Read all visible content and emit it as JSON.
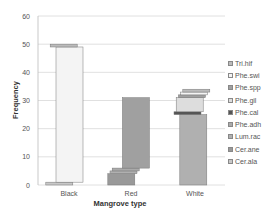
{
  "chart_data": {
    "type": "bar",
    "stacked": true,
    "title": "",
    "xlabel": "Mangrove type",
    "ylabel": "Frequency",
    "ylim": [
      0,
      60
    ],
    "yticks": [
      0,
      10,
      20,
      30,
      40,
      50,
      60
    ],
    "grid": true,
    "legend_position": "right",
    "categories": [
      "Black",
      "Red",
      "White"
    ],
    "series": [
      {
        "name": "Cer.ala",
        "values": [
          1,
          0,
          0
        ],
        "color": "#c8c8c8"
      },
      {
        "name": "Cer.ane",
        "values": [
          0,
          4,
          0
        ],
        "color": "#999999"
      },
      {
        "name": "Lum.rac",
        "values": [
          0,
          1,
          25
        ],
        "color": "#b0b0b0"
      },
      {
        "name": "Phe.adh",
        "values": [
          0,
          1,
          0
        ],
        "color": "#aaaaaa"
      },
      {
        "name": "Phe.cal",
        "values": [
          0,
          0,
          1
        ],
        "color": "#555555"
      },
      {
        "name": "Phe.gil",
        "values": [
          0,
          0,
          5
        ],
        "color": "#dddddd"
      },
      {
        "name": "Phe.spp",
        "values": [
          0,
          25,
          1
        ],
        "color": "#a0a0a0"
      },
      {
        "name": "Phe.swi",
        "values": [
          48,
          0,
          1
        ],
        "color": "#f4f4f4"
      },
      {
        "name": "Tri.hif",
        "values": [
          1,
          0,
          1
        ],
        "color": "#bbbbbb"
      }
    ]
  },
  "legend": [
    "Tri.hif",
    "Phe.swi",
    "Phe.spp",
    "Phe.gil",
    "Phe.cal",
    "Phe.adh",
    "Lum.rac",
    "Cer.ane",
    "Cer.ala"
  ]
}
